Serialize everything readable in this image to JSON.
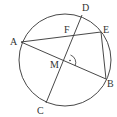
{
  "diagram": {
    "type": "circle-geometry",
    "circle": {
      "cx": 65,
      "cy": 60,
      "r": 46,
      "stroke": "#333333"
    },
    "points": {
      "A": {
        "x": 21,
        "y": 42,
        "label": "A",
        "lx": 10,
        "ly": 45
      },
      "B": {
        "x": 106,
        "y": 79,
        "label": "B",
        "lx": 107,
        "ly": 87
      },
      "C": {
        "x": 46,
        "y": 103,
        "label": "C",
        "lx": 37,
        "ly": 114
      },
      "D": {
        "x": 82,
        "y": 15,
        "label": "D",
        "lx": 82,
        "ly": 11
      },
      "E": {
        "x": 101,
        "y": 32,
        "label": "E",
        "lx": 103,
        "ly": 33
      },
      "F": {
        "x": 74,
        "y": 34,
        "label": "F",
        "lx": 64,
        "ly": 33
      },
      "M": {
        "x": 67,
        "y": 63,
        "label": "M",
        "lx": 50,
        "ly": 68
      }
    },
    "segments": [
      {
        "from": "A",
        "to": "E"
      },
      {
        "from": "A",
        "to": "B"
      },
      {
        "from": "C",
        "to": "D"
      },
      {
        "from": "E",
        "to": "B"
      }
    ],
    "right_angle_marker": {
      "at": "M",
      "label": "·"
    }
  }
}
